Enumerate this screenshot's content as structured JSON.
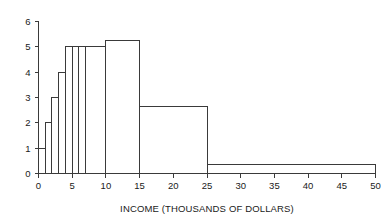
{
  "chart_data": {
    "type": "bar",
    "title": "",
    "xlabel": "INCOME (THOUSANDS OF DOLLARS)",
    "ylabel": "",
    "xlim": [
      0,
      50
    ],
    "ylim": [
      0,
      6
    ],
    "grid": false,
    "legend": null,
    "xticks": [
      0,
      5,
      10,
      15,
      20,
      25,
      30,
      35,
      40,
      45,
      50
    ],
    "xtick_labels": [
      "0",
      "5",
      "10",
      "15",
      "20",
      "25",
      "30",
      "35",
      "40",
      "45",
      "50"
    ],
    "yticks": [
      0,
      1,
      2,
      3,
      4,
      5,
      6
    ],
    "ytick_labels": [
      "0",
      "1",
      "2",
      "3",
      "4",
      "5",
      "6"
    ],
    "bin_edges": [
      0,
      1,
      2,
      3,
      4,
      5,
      6,
      7,
      10,
      15,
      25,
      50
    ],
    "values": [
      1.0,
      2.0,
      3.0,
      4.0,
      5.0,
      5.0,
      5.0,
      5.0,
      5.25,
      2.65,
      0.35
    ],
    "bins": [
      {
        "x0": 0,
        "x1": 1,
        "height": 1.0
      },
      {
        "x0": 1,
        "x1": 2,
        "height": 2.0
      },
      {
        "x0": 2,
        "x1": 3,
        "height": 3.0
      },
      {
        "x0": 3,
        "x1": 4,
        "height": 4.0
      },
      {
        "x0": 4,
        "x1": 5,
        "height": 5.0
      },
      {
        "x0": 5,
        "x1": 6,
        "height": 5.0
      },
      {
        "x0": 6,
        "x1": 7,
        "height": 5.0
      },
      {
        "x0": 7,
        "x1": 10,
        "height": 5.0
      },
      {
        "x0": 10,
        "x1": 15,
        "height": 5.25
      },
      {
        "x0": 15,
        "x1": 25,
        "height": 2.65
      },
      {
        "x0": 25,
        "x1": 50,
        "height": 0.35
      }
    ],
    "colors": {
      "background": "#ffffff",
      "line": "#3a3a3a",
      "text": "#1a1a1a"
    }
  },
  "axes": {
    "x_title": "INCOME (THOUSANDS OF DOLLARS)"
  }
}
